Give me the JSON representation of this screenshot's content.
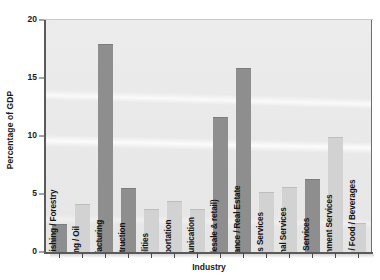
{
  "chart_data": {
    "type": "bar",
    "title": "",
    "xlabel": "Industry",
    "ylabel": "Percentage of GDP",
    "ylim": [
      0,
      20
    ],
    "yticks": [
      0,
      5,
      10,
      15,
      20
    ],
    "ytick_labels": [
      "0",
      "5",
      "10",
      "15",
      "20"
    ],
    "grid": false,
    "legend": null,
    "categories": [
      "Agriculture / Fishing / Forestry",
      "Mining / Oil",
      "Manufacturing",
      "Construction",
      "Utilities",
      "Transportation",
      "Communication",
      "Trade (wholesale & retail)",
      "Finance / Insurance / Real Estate",
      "Business Services",
      "Educational Services",
      "Health Services",
      "Other Government Services",
      "Accommodation / Food / Beverages"
    ],
    "values": [
      2.4,
      4.1,
      17.9,
      5.5,
      3.7,
      4.4,
      3.7,
      11.6,
      15.9,
      5.2,
      5.6,
      6.3,
      9.9,
      2.5
    ],
    "bar_shades": [
      "dark",
      "light",
      "dark",
      "dark",
      "light",
      "light",
      "light",
      "dark",
      "dark",
      "light",
      "light",
      "dark",
      "light",
      "light"
    ],
    "colors": {
      "bar_dark": "#8e8e8e",
      "bar_light": "#d2d2d2",
      "plot_background": "#e9e9e9",
      "axis": "#5a5a5a",
      "text": "#1a1a1a"
    }
  }
}
